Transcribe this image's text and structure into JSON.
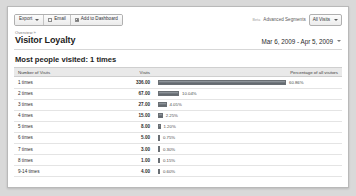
{
  "toolbar": {
    "buttons": [
      {
        "label": "Export",
        "icon": "chevron-down-icon",
        "has_caret": true,
        "icon_kind": "none"
      },
      {
        "label": "Email",
        "icon": "envelope-icon",
        "has_caret": false,
        "icon_kind": "env"
      },
      {
        "label": "Add to Dashboard",
        "icon": "plus-icon",
        "has_caret": false,
        "icon_kind": "plus"
      }
    ],
    "beta_tag": "Beta",
    "advanced_segments_label": "Advanced Segments",
    "segment_selected": "All Visits"
  },
  "header": {
    "breadcrumb": "Overview »",
    "title": "Visitor Loyalty",
    "date_range": "Mar 6, 2009 - Apr 5, 2009"
  },
  "main": {
    "section_title": "Most people visited: 1 times",
    "columns": {
      "label": "Number of Visits",
      "visits": "Visits",
      "percentage": "Percentage of all visitors"
    }
  },
  "chart_data": {
    "type": "bar",
    "title": "Most people visited: 1 times",
    "xlabel": "Percentage of all visitors",
    "ylabel": "Number of Visits",
    "categories": [
      "1 times",
      "2 times",
      "3 times",
      "4 times",
      "5 times",
      "6 times",
      "7 times",
      "8 times",
      "9-14 times"
    ],
    "values": [
      336.0,
      67.0,
      27.0,
      15.0,
      8.0,
      5.0,
      3.0,
      1.0,
      4.0
    ],
    "rows": [
      {
        "label": "1 times",
        "visits": "336.00",
        "percent": "60.86%",
        "percent_value": 60.86
      },
      {
        "label": "2 times",
        "visits": "67.00",
        "percent": "10.04%",
        "percent_value": 10.04
      },
      {
        "label": "3 times",
        "visits": "27.00",
        "percent": "4.05%",
        "percent_value": 4.05
      },
      {
        "label": "4 times",
        "visits": "15.00",
        "percent": "2.25%",
        "percent_value": 2.25
      },
      {
        "label": "5 times",
        "visits": "8.00",
        "percent": "1.20%",
        "percent_value": 1.2
      },
      {
        "label": "6 times",
        "visits": "5.00",
        "percent": "0.75%",
        "percent_value": 0.75
      },
      {
        "label": "7 times",
        "visits": "3.00",
        "percent": "0.30%",
        "percent_value": 0.3
      },
      {
        "label": "8 times",
        "visits": "1.00",
        "percent": "0.15%",
        "percent_value": 0.15
      },
      {
        "label": "9-14 times",
        "visits": "4.00",
        "percent": "0.60%",
        "percent_value": 0.6
      }
    ],
    "grid": false,
    "legend": "none",
    "bar_color": "#6f757b",
    "max_percent": 60.86
  }
}
